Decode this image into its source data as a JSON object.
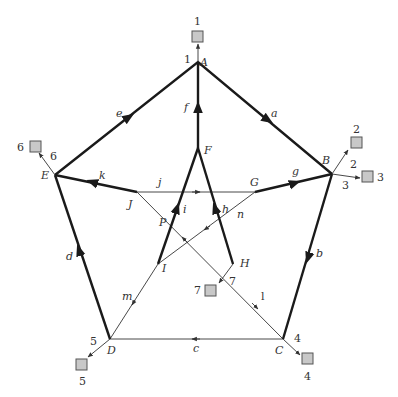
{
  "diagram": {
    "type": "directed-graph",
    "nodes": [
      {
        "id": "A",
        "label": "A",
        "x": 198,
        "y": 62
      },
      {
        "id": "B",
        "label": "B",
        "x": 332,
        "y": 174
      },
      {
        "id": "C",
        "label": "C",
        "x": 283,
        "y": 339
      },
      {
        "id": "D",
        "label": "D",
        "x": 110,
        "y": 339
      },
      {
        "id": "E",
        "label": "E",
        "x": 55,
        "y": 175
      },
      {
        "id": "F",
        "label": "F",
        "x": 198,
        "y": 148
      },
      {
        "id": "G",
        "label": "G",
        "x": 255,
        "y": 192
      },
      {
        "id": "H",
        "label": "H",
        "x": 233,
        "y": 264
      },
      {
        "id": "I",
        "label": "I",
        "x": 158,
        "y": 264
      },
      {
        "id": "J",
        "label": "J",
        "x": 137,
        "y": 192
      },
      {
        "id": "P",
        "label": "P",
        "x": 176,
        "y": 227
      }
    ],
    "edges": [
      {
        "id": "a",
        "label": "a",
        "from": "A",
        "to": "B",
        "weight": "thick"
      },
      {
        "id": "b",
        "label": "b",
        "from": "B",
        "to": "C",
        "weight": "thick"
      },
      {
        "id": "c",
        "label": "c",
        "from": "C",
        "to": "D",
        "weight": "thin"
      },
      {
        "id": "d",
        "label": "d",
        "from": "D",
        "to": "E",
        "weight": "thick"
      },
      {
        "id": "e",
        "label": "e",
        "from": "E",
        "to": "A",
        "weight": "thick"
      },
      {
        "id": "f",
        "label": "f",
        "from": "F",
        "to": "A",
        "weight": "thick"
      },
      {
        "id": "g",
        "label": "g",
        "from": "G",
        "to": "B",
        "weight": "thick"
      },
      {
        "id": "h",
        "label": "h",
        "from": "H",
        "to": "F",
        "weight": "thick"
      },
      {
        "id": "i",
        "label": "i",
        "from": "I",
        "to": "F",
        "weight": "thick"
      },
      {
        "id": "j",
        "label": "j",
        "from": "J",
        "to": "G",
        "weight": "thin"
      },
      {
        "id": "k",
        "label": "k",
        "from": "J",
        "to": "E",
        "weight": "thick"
      },
      {
        "id": "l",
        "label": "l",
        "from": "H",
        "to": "C",
        "weight": "thin"
      },
      {
        "id": "m",
        "label": "m",
        "from": "I",
        "to": "D",
        "weight": "thin"
      },
      {
        "id": "n",
        "label": "n",
        "from": "G",
        "to": "I",
        "weight": "thin"
      }
    ],
    "terminals": [
      {
        "id": "t1",
        "box_label": "1",
        "edge_label": "1",
        "node": "A"
      },
      {
        "id": "t2",
        "box_label": "2",
        "edge_label": "2",
        "node": "B"
      },
      {
        "id": "t3",
        "box_label": "3",
        "edge_label": "3",
        "node": "B"
      },
      {
        "id": "t4",
        "box_label": "4",
        "edge_label": "4",
        "node": "C"
      },
      {
        "id": "t5",
        "box_label": "5",
        "edge_label": "5",
        "node": "D"
      },
      {
        "id": "t6",
        "box_label": "6",
        "edge_label": "6",
        "node": "E"
      },
      {
        "id": "t7",
        "box_label": "7",
        "edge_label": "7",
        "node": "H"
      }
    ],
    "colors": {
      "thick_edge": "#1a1a1a",
      "thin_edge": "#333333",
      "terminal_fill": "#c8c8c8",
      "terminal_stroke": "#555555"
    }
  }
}
